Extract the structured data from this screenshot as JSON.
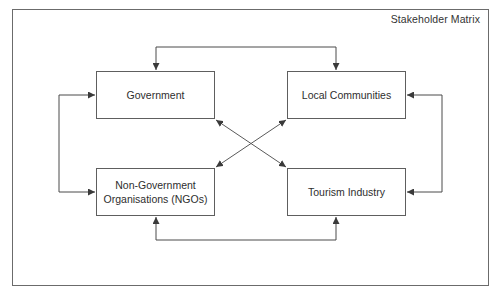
{
  "diagram": {
    "title": "Stakeholder Matrix",
    "type": "stakeholder-relationship-diagram",
    "nodes": [
      {
        "id": "government",
        "label": "Government"
      },
      {
        "id": "local_communities",
        "label": "Local Communities"
      },
      {
        "id": "ngos",
        "label": "Non-Government\nOrganisations (NGOs)"
      },
      {
        "id": "tourism_industry",
        "label": "Tourism Industry"
      }
    ],
    "edges": [
      {
        "from": "government",
        "to": "local_communities",
        "direction": "bidirectional",
        "route": "top"
      },
      {
        "from": "ngos",
        "to": "tourism_industry",
        "direction": "bidirectional",
        "route": "bottom"
      },
      {
        "from": "government",
        "to": "ngos",
        "direction": "bidirectional",
        "route": "left"
      },
      {
        "from": "local_communities",
        "to": "tourism_industry",
        "direction": "bidirectional",
        "route": "right"
      },
      {
        "from": "government",
        "to": "tourism_industry",
        "direction": "bidirectional",
        "route": "diagonal"
      },
      {
        "from": "local_communities",
        "to": "ngos",
        "direction": "bidirectional",
        "route": "diagonal"
      }
    ],
    "colors": {
      "line": "#4a4a4a",
      "border": "#5e5e5e",
      "text": "#2e2e2e",
      "background": "#ffffff"
    }
  }
}
